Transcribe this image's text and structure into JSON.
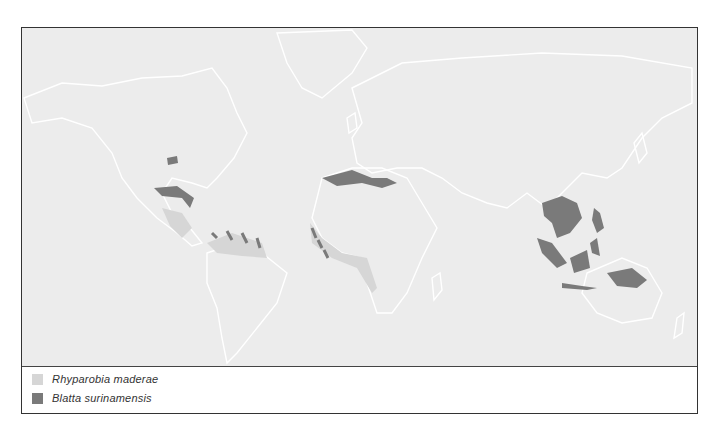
{
  "map": {
    "title": "World distribution map",
    "land_color": "#ececec",
    "coast_color": "#ffffff"
  },
  "legend": {
    "items": [
      {
        "label": "Rhyparobia maderae",
        "color": "#d6d6d6"
      },
      {
        "label": "Blatta surinamensis",
        "color": "#7a7a7a"
      }
    ]
  }
}
